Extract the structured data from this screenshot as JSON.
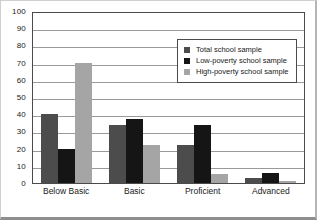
{
  "chart_data": {
    "type": "bar",
    "title": "",
    "subtitle": "",
    "xlabel": "",
    "ylabel": "",
    "ylim": [
      0,
      100
    ],
    "ytick_step": 10,
    "yticks": [
      100,
      90,
      80,
      70,
      60,
      50,
      40,
      30,
      20,
      10,
      0
    ],
    "ytick_labels": [
      "100",
      "90",
      "80",
      "70",
      "60",
      "50",
      "40",
      "30",
      "20",
      "10",
      "0"
    ],
    "categories": [
      "Below Basic",
      "Basic",
      "Proficient",
      "Advanced"
    ],
    "grid": true,
    "grid_axis": "y",
    "legend_position": "upper-right-inside",
    "series": [
      {
        "name": "Total school sample",
        "color": "#4c4c4c",
        "values": [
          40,
          34,
          22,
          3
        ]
      },
      {
        "name": "Low-poverty school sample",
        "color": "#151515",
        "values": [
          20,
          37,
          34,
          6
        ]
      },
      {
        "name": "High-poverty school sample",
        "color": "#a5a5a5",
        "values": [
          70,
          22,
          5,
          1
        ]
      }
    ]
  },
  "legend": {
    "items": [
      {
        "label": "Total school sample",
        "swatch": "#4c4c4c"
      },
      {
        "label": "Low-poverty school sample",
        "swatch": "#151515"
      },
      {
        "label": "High-poverty school sample",
        "swatch": "#a5a5a5"
      }
    ]
  },
  "colors": {
    "plot_border": "#4a4a4a",
    "gridline": "#9a9a9a",
    "background": "#ffffff",
    "text": "#1a1a1a",
    "series_total": "#4c4c4c",
    "series_low_poverty": "#151515",
    "series_high_poverty": "#a5a5a5"
  }
}
